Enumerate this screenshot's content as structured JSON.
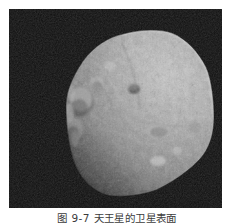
{
  "figure": {
    "kind": "grayscale-astronomical-photograph",
    "caption": {
      "full_text": "图 9-7  天王星的卫星表面",
      "visible_fragment": "图 9-7  天王星的卫星表面",
      "note": "caption is clipped by the bottom edge of the screenshot; only the tops of the glyphs are rendered"
    },
    "plate": {
      "x": 9,
      "y": 9,
      "width": 213,
      "height": 199,
      "background_color": "#0b0b0b",
      "border_color": "#ffffff"
    },
    "colors": {
      "page_background": "#ffffff",
      "space_background": "#0b0b0b",
      "space_background_mottle": "#1c1c1c",
      "terminator_shadow": "#101010",
      "body_midtone": "#9a9a9a",
      "body_highlight": "#d6d6d6",
      "body_bright_rim": "#ededed",
      "body_shade": "#6a6a6a",
      "body_dark_shade": "#3e3e3e",
      "caption_text": "#3c3c3c"
    },
    "body_outline": {
      "description": "rounded polygonal limb of the moon within the plate",
      "points": "57,95 62,70 74,52 92,36 114,25 139,20 163,24 184,38 197,58 204,82 205,108 200,132 188,153 170,170 147,181 122,187 98,186 80,177 68,160 60,138 57,116"
    },
    "surface_features": [
      {
        "name": "bright-crater-rim-cluster",
        "cx": 70,
        "cy": 95,
        "r": 16,
        "tone": "#e2e2e2"
      },
      {
        "name": "bright-crater-rim",
        "cx": 62,
        "cy": 118,
        "r": 10,
        "tone": "#dedede"
      },
      {
        "name": "limb-highlight-ridge",
        "cx": 86,
        "cy": 56,
        "r": 14,
        "tone": "#d2d2d2"
      },
      {
        "name": "dark-crater-floor",
        "cx": 124,
        "cy": 80,
        "r": 6,
        "tone": "#4a4a4a"
      },
      {
        "name": "central-groove-system",
        "cx": 146,
        "cy": 120,
        "r": 18,
        "tone": "#b0b0b0"
      },
      {
        "name": "bright-ejecta-patch",
        "cx": 148,
        "cy": 152,
        "r": 9,
        "tone": "#e6e6e6"
      },
      {
        "name": "terminator-shadow-lobe",
        "cx": 64,
        "cy": 160,
        "r": 22,
        "tone": "#141414"
      }
    ]
  }
}
